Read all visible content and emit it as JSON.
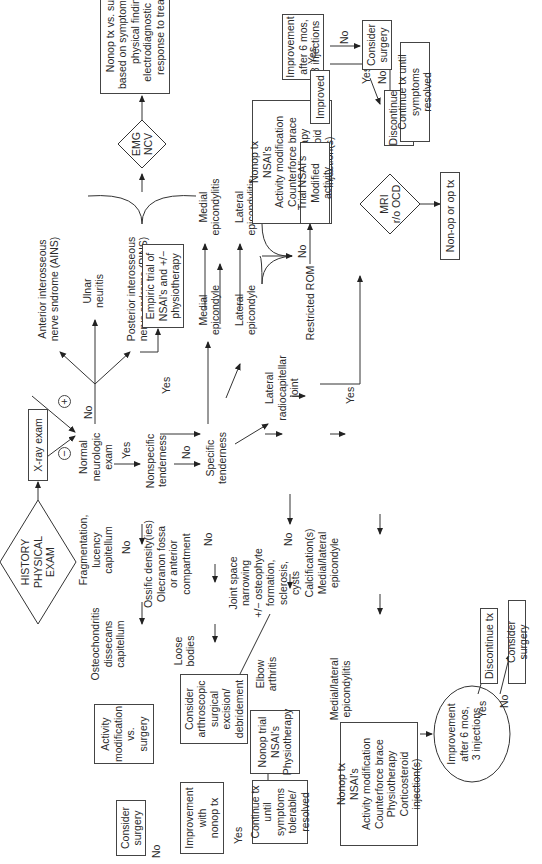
{
  "diagram": {
    "orientation": "rotated 90 degrees counter-clockwise",
    "start": {
      "label": "HISTORY\nPHYSICAL\nEXAM",
      "shape": "diamond"
    },
    "xray": {
      "label": "X-ray exam",
      "positive_sign": "+",
      "negative_sign": "−"
    },
    "negative_branch": {
      "normal_neuro": "Normal\nneurologic\nexam",
      "no_label": "No",
      "yes_label": "Yes",
      "ains": "Anterior interosseous\nnerve sndrome (AINS)",
      "ulnar": "Ulnar\nneuritis",
      "pins": "Posterior interosseous\nnerve sndrome (PINS)",
      "emg": {
        "label": "EMG\nNCV",
        "shape": "diamond"
      },
      "nonop_vs_surgery": "Nonop tx vs. surgery\nbased on symptom severity,\nphysical findings,\nelectrodiagnostic results,\nresponse to treatment",
      "nonspecific": "Nonspecific\ntenderness",
      "nonspecific_yes": "Yes",
      "nonspecific_no": "No",
      "empiric": "Empiric trial of\nNSAI's and +/−\nphysiotherapy",
      "specific": "Specific\ntenderness",
      "medial_epicondyle": "Medial\nepicondyle",
      "medial_epicondylitis": "Medial\nepicondylitis",
      "lateral_epicondyle": "Lateral\nepicondyle",
      "lateral_epicondylitis": "Lateral\nepicondylitis",
      "nonop_tx_box": "Nonop tx\nNSAI's\nActivity modification\nCounterforce brace\nPhysiotherapy\nCorticosteroid injection(s)",
      "improvement_box": "Improvement\nafter 6 mos,\n3 injections",
      "improvement_no": "No",
      "improvement_yes": "Yes",
      "consider_surgery": "Consider\nsurgery",
      "discontinue": "Discontinue\ntx",
      "lateral_radiocapitellar": "Lateral\nradiocapitellar\njoint",
      "restricted_rom": "Restricted ROM",
      "rom_no": "No",
      "rom_yes": "Yes",
      "trial_nsai": "Trial NSAI's\nModified activity",
      "improved": "Improved",
      "improved_yes": "Yes",
      "improved_no": "No",
      "continue_tx": "Continue tx until\nsymptoms resolved",
      "mri": {
        "label": "MRI\nr/o OCD",
        "shape": "diamond"
      },
      "nonop_or_op": "Non-op or op tx"
    },
    "positive_branch": {
      "fragmentation": "Fragmentation,\nlucency\ncapitellum",
      "frag_no": "No",
      "ocd": "Osteochondritis\ndissecans\ncapitellum",
      "activity_mod": "Activity\nmodification\nvs.\nsurgery",
      "ossific": "Ossific density(ies)\nOlecranon fossa\nor anterior\ncompartment",
      "ossific_no": "No",
      "loose_bodies": "Loose\nbodies",
      "arthroscopic": "Consider\narthroscopic\nsurgical\nexcision/\ndebridement",
      "joint_space": "Joint space\nnarrowing\n+/− osteophyte\nformation,\nsclerosis,\ncysts",
      "joint_no": "No",
      "elbow_arthritis": "Elbow\narthritis",
      "nonop_trial": "Nonop trial\nNSAI's\nPhysiotherapy",
      "improvement_nonop": "Improvement\nwith\nnonop tx",
      "imp_no": "No",
      "imp_yes": "Yes",
      "consider_surgery_2": "Consider\nsurgery",
      "continue_tolerable": "Continue tx\nuntil symptoms\ntolerable/\nresolved",
      "calcification": "Calcification(s)\nMedial/lateral\nepicondyle",
      "ml_epicondylitis": "Medial/lateral\nepicondylitis",
      "nonop_tx_box_2": "Nonop tx\nNSAI's\nActivity modification\nCounterforce brace\nPhysiotherapy\nCorticosteroid injection(s)",
      "improvement_oval": "Improvement\nafter 6 mos,\n3 injections",
      "oval_yes": "Yes",
      "oval_no": "No",
      "discontinue_2": "Discontinue tx",
      "consider_surgery_3": "Consider surgery"
    }
  }
}
